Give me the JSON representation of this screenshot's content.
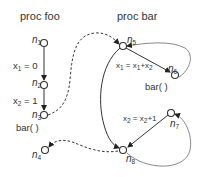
{
  "diagram": {
    "procedures": [
      {
        "id": "foo",
        "title": "proc foo"
      },
      {
        "id": "bar",
        "title": "proc bar"
      }
    ],
    "nodes": [
      {
        "id": "n1",
        "base": "n",
        "sub": "1",
        "proc": "foo"
      },
      {
        "id": "n2",
        "base": "n",
        "sub": "2",
        "proc": "foo"
      },
      {
        "id": "n3",
        "base": "n",
        "sub": "3",
        "proc": "foo"
      },
      {
        "id": "n4",
        "base": "n",
        "sub": "4",
        "proc": "foo"
      },
      {
        "id": "n5",
        "base": "n",
        "sub": "5",
        "proc": "bar"
      },
      {
        "id": "n6",
        "base": "n",
        "sub": "6",
        "proc": "bar"
      },
      {
        "id": "n7",
        "base": "n",
        "sub": "7",
        "proc": "bar"
      },
      {
        "id": "n8",
        "base": "n",
        "sub": "8",
        "proc": "bar"
      }
    ],
    "edge_labels": {
      "e12": {
        "pre": "x",
        "sub1": "1",
        "post": " = 0"
      },
      "e23": {
        "pre": "x",
        "sub1": "2",
        "post": " = 1"
      },
      "call_foo": "bar( )",
      "e56": {
        "a": "x",
        "a_sub": "1",
        "eq": " = x",
        "b_sub": "1",
        "plus": "+x",
        "c_sub": "2"
      },
      "call_bar": "bar( )",
      "e78": {
        "a": "x",
        "a_sub": "2",
        "eq": " = x",
        "b_sub": "2",
        "plus": "+1"
      }
    },
    "edges": [
      {
        "from": "n1",
        "to": "n2",
        "style": "solid"
      },
      {
        "from": "n2",
        "to": "n3",
        "style": "solid"
      },
      {
        "from": "n3",
        "to": "n5",
        "style": "dashed",
        "kind": "call"
      },
      {
        "from": "n8",
        "to": "n4",
        "style": "dashed",
        "kind": "return"
      },
      {
        "from": "n5",
        "to": "n6",
        "style": "solid"
      },
      {
        "from": "n5",
        "to": "n8",
        "style": "solid"
      },
      {
        "from": "n6",
        "to": "n5",
        "style": "gray",
        "kind": "call"
      },
      {
        "from": "n8",
        "to": "n7",
        "style": "gray",
        "kind": "return"
      },
      {
        "from": "n7",
        "to": "n8",
        "style": "solid"
      }
    ]
  }
}
